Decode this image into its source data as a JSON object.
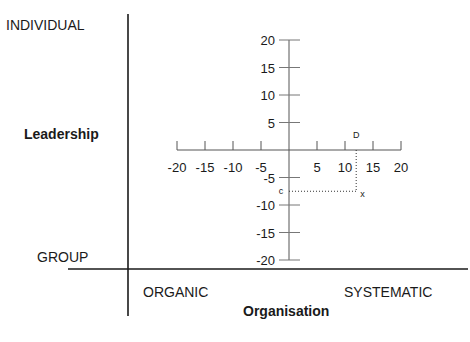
{
  "chart_data": {
    "type": "scatter",
    "title": "",
    "outer_axes": {
      "y_label": "Leadership",
      "y_top": "INDIVIDUAL",
      "y_bottom": "GROUP",
      "x_label": "Organisation",
      "x_left": "ORGANIC",
      "x_right": "SYSTEMATIC"
    },
    "xlim": [
      -20,
      20
    ],
    "ylim": [
      -20,
      20
    ],
    "x_ticks": [
      -20,
      -15,
      -10,
      -5,
      5,
      10,
      15,
      20
    ],
    "y_ticks": [
      20,
      15,
      10,
      5,
      -5,
      -10,
      -15,
      -20
    ],
    "grid": false,
    "points": [
      {
        "name": "X",
        "label": "x",
        "x": 12,
        "y": -7.5
      }
    ],
    "projections": [
      {
        "name": "C",
        "label": "c",
        "axis": "y",
        "value": -7.5
      },
      {
        "name": "D",
        "label": "D",
        "axis": "x",
        "value": 12
      }
    ]
  }
}
